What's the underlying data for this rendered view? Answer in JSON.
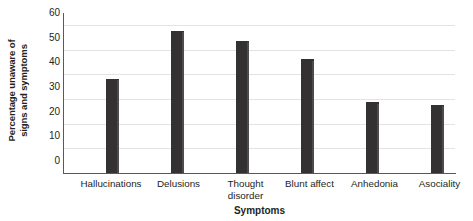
{
  "chart_data": {
    "type": "bar",
    "title": "",
    "xlabel": "Symptoms",
    "ylabel": "Percentage unaware of signs and symptoms",
    "ylabel_lines": [
      "Percentage unaware of",
      "signs and symptoms"
    ],
    "categories": [
      "Hallucinations",
      "Delusions",
      "Thought disorder",
      "Blunt affect",
      "Anhedonia",
      "Asociality"
    ],
    "category_lines": [
      [
        "Hallucinations"
      ],
      [
        "Delusions"
      ],
      [
        "Thought",
        "disorder"
      ],
      [
        "Blunt affect"
      ],
      [
        "Anhedonia"
      ],
      [
        "Asociality"
      ]
    ],
    "values": [
      38,
      57.5,
      53.5,
      46,
      28.5,
      27.5
    ],
    "ylim": [
      0,
      60
    ],
    "yticks": [
      0,
      10,
      20,
      30,
      40,
      50,
      60
    ],
    "ytick_labels": [
      "0",
      "10",
      "20",
      "30",
      "40",
      "50",
      "60"
    ],
    "grid": true,
    "grid_axis": "y",
    "legend": false,
    "bar_color": "#333132",
    "bar_side_color": "#4d4b4c",
    "grid_color": "#e3e3e4",
    "axis_color": "#58595b",
    "text_color": "#231f20"
  }
}
